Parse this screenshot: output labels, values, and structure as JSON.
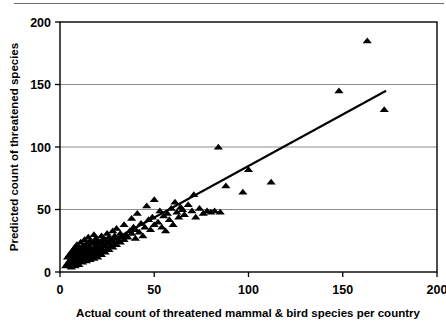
{
  "chart_data": {
    "type": "scatter",
    "title": "",
    "xlabel": "Actual count of threatened mammal & bird species per country",
    "ylabel": "Predicted count of threatened species",
    "xlim": [
      0,
      200
    ],
    "ylim": [
      0,
      200
    ],
    "xticks": [
      0,
      50,
      100,
      150,
      200
    ],
    "yticks": [
      0,
      50,
      100,
      150,
      200
    ],
    "xtick_labels": [
      "0",
      "50",
      "100",
      "150",
      "200"
    ],
    "ytick_labels": [
      "0",
      "50",
      "100",
      "150",
      "200"
    ],
    "grid": "horizontal",
    "legend": "none",
    "marker": "filled-triangle",
    "marker_color": "#000000",
    "trendline": {
      "type": "line",
      "color": "#000000",
      "x": [
        2,
        173
      ],
      "y": [
        4,
        145
      ]
    },
    "points": [
      [
        3,
        5
      ],
      [
        4,
        7
      ],
      [
        4,
        12
      ],
      [
        5,
        6
      ],
      [
        5,
        9
      ],
      [
        5,
        14
      ],
      [
        6,
        4
      ],
      [
        6,
        8
      ],
      [
        6,
        11
      ],
      [
        6,
        16
      ],
      [
        7,
        7
      ],
      [
        7,
        10
      ],
      [
        7,
        13
      ],
      [
        7,
        18
      ],
      [
        8,
        5
      ],
      [
        8,
        9
      ],
      [
        8,
        12
      ],
      [
        8,
        15
      ],
      [
        8,
        20
      ],
      [
        9,
        8
      ],
      [
        9,
        11
      ],
      [
        9,
        14
      ],
      [
        9,
        17
      ],
      [
        9,
        22
      ],
      [
        10,
        6
      ],
      [
        10,
        10
      ],
      [
        10,
        13
      ],
      [
        10,
        16
      ],
      [
        10,
        19
      ],
      [
        11,
        9
      ],
      [
        11,
        12
      ],
      [
        11,
        15
      ],
      [
        11,
        18
      ],
      [
        11,
        24
      ],
      [
        12,
        8
      ],
      [
        12,
        11
      ],
      [
        12,
        14
      ],
      [
        12,
        17
      ],
      [
        12,
        21
      ],
      [
        13,
        10
      ],
      [
        13,
        13
      ],
      [
        13,
        16
      ],
      [
        13,
        20
      ],
      [
        13,
        26
      ],
      [
        14,
        9
      ],
      [
        14,
        12
      ],
      [
        14,
        15
      ],
      [
        14,
        19
      ],
      [
        14,
        23
      ],
      [
        15,
        11
      ],
      [
        15,
        14
      ],
      [
        15,
        17
      ],
      [
        15,
        21
      ],
      [
        15,
        28
      ],
      [
        16,
        10
      ],
      [
        16,
        13
      ],
      [
        16,
        16
      ],
      [
        16,
        20
      ],
      [
        16,
        25
      ],
      [
        17,
        12
      ],
      [
        17,
        15
      ],
      [
        17,
        18
      ],
      [
        17,
        23
      ],
      [
        18,
        11
      ],
      [
        18,
        14
      ],
      [
        18,
        19
      ],
      [
        18,
        24
      ],
      [
        18,
        30
      ],
      [
        19,
        13
      ],
      [
        19,
        17
      ],
      [
        19,
        21
      ],
      [
        19,
        27
      ],
      [
        20,
        12
      ],
      [
        20,
        16
      ],
      [
        20,
        20
      ],
      [
        20,
        25
      ],
      [
        21,
        15
      ],
      [
        21,
        19
      ],
      [
        21,
        24
      ],
      [
        22,
        14
      ],
      [
        22,
        18
      ],
      [
        22,
        23
      ],
      [
        22,
        29
      ],
      [
        23,
        17
      ],
      [
        23,
        22
      ],
      [
        23,
        27
      ],
      [
        24,
        16
      ],
      [
        24,
        21
      ],
      [
        24,
        26
      ],
      [
        25,
        19
      ],
      [
        25,
        24
      ],
      [
        25,
        31
      ],
      [
        26,
        18
      ],
      [
        26,
        23
      ],
      [
        26,
        28
      ],
      [
        27,
        21
      ],
      [
        27,
        26
      ],
      [
        28,
        20
      ],
      [
        28,
        25
      ],
      [
        28,
        33
      ],
      [
        29,
        23
      ],
      [
        29,
        29
      ],
      [
        30,
        22
      ],
      [
        30,
        27
      ],
      [
        30,
        35
      ],
      [
        31,
        25
      ],
      [
        32,
        24
      ],
      [
        32,
        31
      ],
      [
        33,
        28
      ],
      [
        34,
        26
      ],
      [
        34,
        38
      ],
      [
        35,
        30
      ],
      [
        36,
        28
      ],
      [
        37,
        33
      ],
      [
        38,
        31
      ],
      [
        38,
        43
      ],
      [
        39,
        36
      ],
      [
        40,
        27
      ],
      [
        40,
        34
      ],
      [
        41,
        47
      ],
      [
        42,
        32
      ],
      [
        43,
        39
      ],
      [
        44,
        29
      ],
      [
        45,
        36
      ],
      [
        46,
        53
      ],
      [
        47,
        42
      ],
      [
        48,
        34
      ],
      [
        49,
        44
      ],
      [
        50,
        38
      ],
      [
        50,
        58
      ],
      [
        52,
        40
      ],
      [
        53,
        49
      ],
      [
        54,
        36
      ],
      [
        55,
        45
      ],
      [
        56,
        33
      ],
      [
        57,
        47
      ],
      [
        58,
        42
      ],
      [
        59,
        51
      ],
      [
        60,
        38
      ],
      [
        61,
        56
      ],
      [
        62,
        48
      ],
      [
        63,
        44
      ],
      [
        64,
        52
      ],
      [
        65,
        50
      ],
      [
        66,
        46
      ],
      [
        68,
        54
      ],
      [
        70,
        49
      ],
      [
        71,
        62
      ],
      [
        72,
        44
      ],
      [
        74,
        51
      ],
      [
        76,
        47
      ],
      [
        78,
        49
      ],
      [
        80,
        48
      ],
      [
        82,
        49
      ],
      [
        84,
        100
      ],
      [
        85,
        48
      ],
      [
        88,
        69
      ],
      [
        97,
        64
      ],
      [
        100,
        82
      ],
      [
        112,
        72
      ],
      [
        148,
        145
      ],
      [
        163,
        185
      ],
      [
        172,
        130
      ]
    ]
  }
}
